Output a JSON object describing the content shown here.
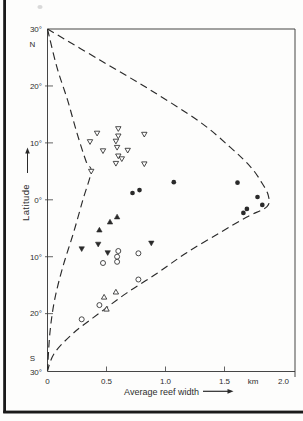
{
  "page": {
    "colors": {
      "ink": "#2a2a2a",
      "frame": "#3c3c3c",
      "paper": "#fdfdfc",
      "page_edge": "#1a1a1a",
      "artifact": "#d9d9d9"
    }
  },
  "chart_data": {
    "type": "scatter",
    "title": "",
    "xlabel": "Average reef width",
    "x_unit_label": "km",
    "ylabel": "Latitude",
    "xlim": [
      0,
      2.0
    ],
    "ylim_deg_north": [
      -30,
      30
    ],
    "grid": false,
    "legend": "none",
    "x_ticks": [
      {
        "v": 0.0,
        "label": "0"
      },
      {
        "v": 0.5,
        "label": "0.5"
      },
      {
        "v": 1.0,
        "label": "1.0"
      },
      {
        "v": 1.5,
        "label": "1.5"
      },
      {
        "v": 2.0,
        "label": "2.0"
      }
    ],
    "y_ticks": [
      {
        "v": 30,
        "label": "30°"
      },
      {
        "v": 20,
        "label": "20°"
      },
      {
        "v": 10,
        "label": "10°"
      },
      {
        "v": 0,
        "label": "0°"
      },
      {
        "v": -10,
        "label": "10°"
      },
      {
        "v": -20,
        "label": "20°"
      },
      {
        "v": -30,
        "label": "30°"
      }
    ],
    "hemisphere_labels": {
      "north": "N",
      "south": "S"
    },
    "envelope_dashed": {
      "right_lobe": [
        [
          0.0,
          30.0
        ],
        [
          0.44,
          24.6
        ],
        [
          0.87,
          19.3
        ],
        [
          1.29,
          13.7
        ],
        [
          1.55,
          9.2
        ],
        [
          1.72,
          5.8
        ],
        [
          1.81,
          3.2
        ],
        [
          1.87,
          0.8
        ],
        [
          1.86,
          -1.2
        ],
        [
          1.69,
          -3.0
        ],
        [
          1.46,
          -5.8
        ],
        [
          1.18,
          -9.3
        ],
        [
          0.93,
          -12.9
        ],
        [
          0.67,
          -16.4
        ],
        [
          0.44,
          -19.9
        ],
        [
          0.22,
          -23.4
        ],
        [
          0.06,
          -26.9
        ],
        [
          0.0,
          -30.0
        ]
      ],
      "left_bulge": [
        [
          0.0,
          30.0
        ],
        [
          0.08,
          23.3
        ],
        [
          0.17,
          17.5
        ],
        [
          0.25,
          11.7
        ],
        [
          0.33,
          6.6
        ],
        [
          0.37,
          5.0
        ],
        [
          0.3,
          0.0
        ],
        [
          0.22,
          -5.8
        ],
        [
          0.13,
          -11.8
        ],
        [
          0.06,
          -17.6
        ],
        [
          0.02,
          -23.4
        ],
        [
          0.0,
          -30.0
        ]
      ]
    },
    "series": [
      {
        "name": "open-down-triangles",
        "marker": "open-down-triangle",
        "points": [
          [
            0.42,
            11.7
          ],
          [
            0.36,
            10.2
          ],
          [
            0.47,
            8.6
          ],
          [
            0.37,
            5.0
          ],
          [
            0.6,
            12.5
          ],
          [
            0.6,
            11.2
          ],
          [
            0.58,
            10.3
          ],
          [
            0.59,
            9.2
          ],
          [
            0.68,
            8.7
          ],
          [
            0.6,
            7.7
          ],
          [
            0.63,
            7.2
          ],
          [
            0.58,
            6.4
          ],
          [
            0.82,
            11.5
          ],
          [
            0.82,
            6.3
          ]
        ]
      },
      {
        "name": "filled-circles",
        "marker": "filled-circle",
        "points": [
          [
            0.72,
            1.2
          ],
          [
            0.78,
            1.7
          ],
          [
            1.07,
            3.1
          ],
          [
            1.61,
            3.0
          ],
          [
            1.78,
            0.5
          ],
          [
            1.82,
            -0.9
          ],
          [
            1.69,
            -1.6
          ],
          [
            1.66,
            -2.3
          ]
        ]
      },
      {
        "name": "filled-up-triangles",
        "marker": "filled-up-triangle",
        "points": [
          [
            0.59,
            -3.0
          ],
          [
            0.53,
            -3.9
          ],
          [
            0.44,
            -5.3
          ]
        ]
      },
      {
        "name": "filled-down-triangles",
        "marker": "filled-down-triangle",
        "points": [
          [
            0.29,
            -8.6
          ],
          [
            0.43,
            -7.8
          ],
          [
            0.51,
            -9.3
          ],
          [
            0.88,
            -7.6
          ]
        ]
      },
      {
        "name": "open-circles",
        "marker": "open-circle",
        "points": [
          [
            0.6,
            -9.0
          ],
          [
            0.59,
            -10.0
          ],
          [
            0.59,
            -10.9
          ],
          [
            0.47,
            -11.1
          ],
          [
            0.77,
            -9.4
          ],
          [
            0.77,
            -14.0
          ],
          [
            0.44,
            -18.5
          ],
          [
            0.29,
            -21.0
          ]
        ]
      },
      {
        "name": "open-up-triangles",
        "marker": "open-up-triangle",
        "points": [
          [
            0.48,
            -17.1
          ],
          [
            0.58,
            -16.2
          ],
          [
            0.5,
            -19.2
          ]
        ]
      }
    ]
  }
}
